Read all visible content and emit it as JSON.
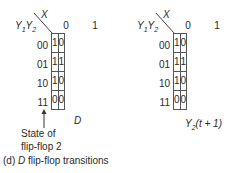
{
  "maps": [
    {
      "id": "left",
      "row_var": "Y1Y2",
      "col_var": "X",
      "col_headers": [
        "0",
        "1"
      ],
      "row_headers": [
        "00",
        "01",
        "10",
        "11"
      ],
      "cells": [
        [
          "1",
          "0"
        ],
        [
          "1",
          "1"
        ],
        [
          "1",
          "0"
        ],
        [
          "0",
          "0"
        ]
      ],
      "title": "D"
    },
    {
      "id": "right",
      "row_var": "Y1Y2",
      "col_var": "X",
      "col_headers": [
        "0",
        "1"
      ],
      "row_headers": [
        "00",
        "01",
        "10",
        "11"
      ],
      "cells": [
        [
          "1",
          "0"
        ],
        [
          "1",
          "1"
        ],
        [
          "1",
          "0"
        ],
        [
          "0",
          "0"
        ]
      ],
      "title": "Y2(t + 1)"
    }
  ],
  "labels": {
    "y1": "Y",
    "y1_sub": "1",
    "y2": "Y",
    "y2_sub": "2",
    "x": "X",
    "arrow_note_line1": "State of",
    "arrow_note_line2": "flip-flop 2",
    "left_title": "D",
    "right_title_main": "Y",
    "right_title_sub": "2",
    "right_title_rest": "(t + 1)",
    "caption_prefix": "(d) ",
    "caption_italic": "D",
    "caption_rest": " flip-flop transitions"
  }
}
